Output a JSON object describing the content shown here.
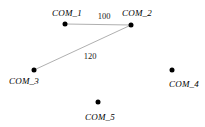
{
  "figure": {
    "type": "node-link-diagram",
    "width": 205,
    "height": 127,
    "background_color": "#ffffff",
    "node_color": "#000000",
    "edge_color": "#b0b0b0",
    "label_color": "#000000"
  },
  "nodes": [
    {
      "id": "COM_1",
      "label": "COM_1",
      "x": 65,
      "y": 24,
      "label_x": 67,
      "label_y": 13
    },
    {
      "id": "COM_2",
      "label": "COM_2",
      "x": 131,
      "y": 25,
      "label_x": 137,
      "label_y": 13
    },
    {
      "id": "COM_3",
      "label": "COM_3",
      "x": 34,
      "y": 70,
      "label_x": 24,
      "label_y": 81
    },
    {
      "id": "COM_4",
      "label": "COM_4",
      "x": 172,
      "y": 70,
      "label_x": 184,
      "label_y": 84
    },
    {
      "id": "COM_5",
      "label": "COM_5",
      "x": 98,
      "y": 102,
      "label_x": 100,
      "label_y": 117
    }
  ],
  "edges": [
    {
      "from": "COM_1",
      "to": "COM_2",
      "weight": "100",
      "x1": 65,
      "y1": 24,
      "x2": 131,
      "y2": 25,
      "label_x": 104,
      "label_y": 16
    },
    {
      "from": "COM_2",
      "to": "COM_3",
      "weight": "120",
      "x1": 131,
      "y1": 25,
      "x2": 34,
      "y2": 70,
      "label_x": 90,
      "label_y": 56
    }
  ],
  "chart_data": {
    "type": "scatter",
    "title": "",
    "xlabel": "",
    "ylabel": "",
    "categories": [
      "COM_1",
      "COM_2",
      "COM_3",
      "COM_4",
      "COM_5"
    ],
    "edge_weights": [
      "100",
      "120"
    ]
  }
}
